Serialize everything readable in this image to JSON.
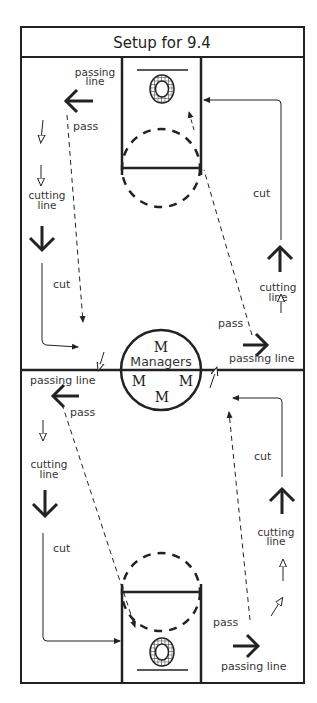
{
  "title": "Setup for 9.4",
  "center": {
    "label": "Managers",
    "marker": "M",
    "marker_count": 4
  },
  "top_half": {
    "left": {
      "passing_line_label": [
        "passing",
        "line"
      ],
      "pass_label": "pass",
      "cutting_line_label": [
        "cutting",
        "line"
      ],
      "cut_label": "cut"
    },
    "right": {
      "cut_label": "cut",
      "cutting_line_label": [
        "cutting",
        "line"
      ],
      "pass_label": "pass",
      "passing_line_label": "passing line"
    }
  },
  "bottom_half": {
    "left": {
      "passing_line_label": "passing line",
      "pass_label": "pass",
      "cutting_line_label": [
        "cutting",
        "line"
      ],
      "cut_label": "cut"
    },
    "right": {
      "cut_label": "cut",
      "cutting_line_label": [
        "cutting",
        "line"
      ],
      "pass_label": "pass",
      "passing_line_label": "passing line"
    }
  },
  "icons": {
    "basket": "basket-hoop-icon",
    "solid_arrow": "solid-arrow-icon",
    "hollow_arrow": "hollow-arrow-icon",
    "dashed_arrow": "pass-path-dashed-arrow",
    "cut_path": "cut-path-arrow"
  },
  "colors": {
    "ink": "#222222",
    "background": "#ffffff"
  }
}
